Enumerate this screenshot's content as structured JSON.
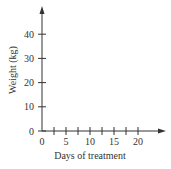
{
  "chart_data": {
    "type": "line",
    "title": "",
    "xlabel": "Days of treatment",
    "ylabel": "Weight (kg)",
    "xlim": [
      0,
      25
    ],
    "ylim": [
      0,
      50
    ],
    "x_ticks": [
      0,
      5,
      10,
      15,
      20
    ],
    "x_minor_ticks": [
      2.5,
      7.5,
      12.5,
      17.5
    ],
    "y_ticks": [
      0,
      10,
      20,
      30,
      40
    ],
    "series": [],
    "grid": false,
    "legend": null
  },
  "colors": {
    "axis": "#333333",
    "text": "#333333"
  }
}
